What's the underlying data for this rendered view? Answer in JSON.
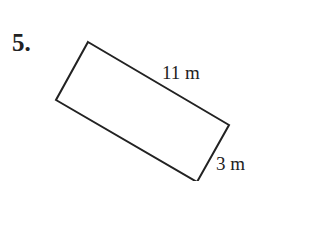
{
  "problem": {
    "number": "5.",
    "shape": "rectangle",
    "length_label": "11 m",
    "width_label": "3 m"
  },
  "figure": {
    "stroke_color": "#222222",
    "vertices": [
      [
        88,
        42
      ],
      [
        229,
        125
      ],
      [
        197,
        182
      ],
      [
        56,
        100
      ]
    ]
  }
}
